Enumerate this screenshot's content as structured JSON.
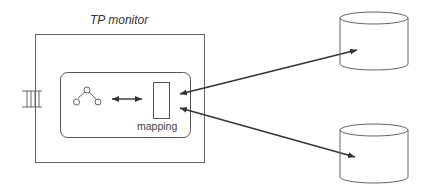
{
  "diagram": {
    "title": "TP monitor",
    "mapping_label": "mapping",
    "stroke_color": "#555555",
    "arrow_color": "#333333",
    "components": [
      {
        "id": "queue",
        "kind": "queue-icon"
      },
      {
        "id": "tp-monitor",
        "kind": "box",
        "label": "TP monitor"
      },
      {
        "id": "application",
        "kind": "rounded-box"
      },
      {
        "id": "tree",
        "kind": "tree-icon"
      },
      {
        "id": "mapping",
        "kind": "rect",
        "label": "mapping"
      },
      {
        "id": "db-top",
        "kind": "cylinder"
      },
      {
        "id": "db-bottom",
        "kind": "cylinder"
      }
    ],
    "edges": [
      {
        "from": "tree",
        "to": "mapping",
        "type": "bidirectional"
      },
      {
        "from": "mapping",
        "to": "db-top",
        "type": "bidirectional"
      },
      {
        "from": "mapping",
        "to": "db-bottom",
        "type": "bidirectional"
      }
    ]
  }
}
